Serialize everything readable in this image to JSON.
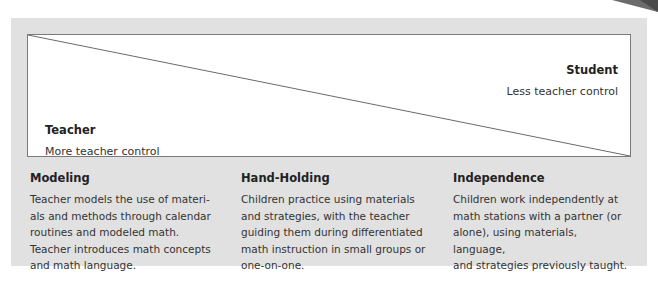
{
  "diagram": {
    "type": "continuum-scale",
    "scale": {
      "right_end": {
        "title": "Student",
        "subtitle": "Less teacher control"
      },
      "left_end": {
        "title": "Teacher",
        "subtitle": "More teacher control"
      }
    },
    "stages": [
      {
        "title": "Modeling",
        "lines": [
          "Teacher models the use of materi-",
          "als and methods through calendar",
          "routines and modeled math.",
          "Teacher introduces math concepts",
          "and math language."
        ]
      },
      {
        "title": "Hand-Holding",
        "lines": [
          "Children practice using materials",
          "and strategies, with the teacher",
          "guiding them during differentiated",
          "math instruction in small groups or",
          "one-on-one."
        ]
      },
      {
        "title": "Independence",
        "lines": [
          "Children work independently at",
          "math stations with a partner (or",
          "alone), using materials, language,",
          "and strategies previously taught."
        ]
      }
    ],
    "colors": {
      "panel_bg": "#e1e1e1",
      "box_bg": "#ffffff",
      "line": "#6a6a6a",
      "corner_tab": "#555555"
    }
  }
}
